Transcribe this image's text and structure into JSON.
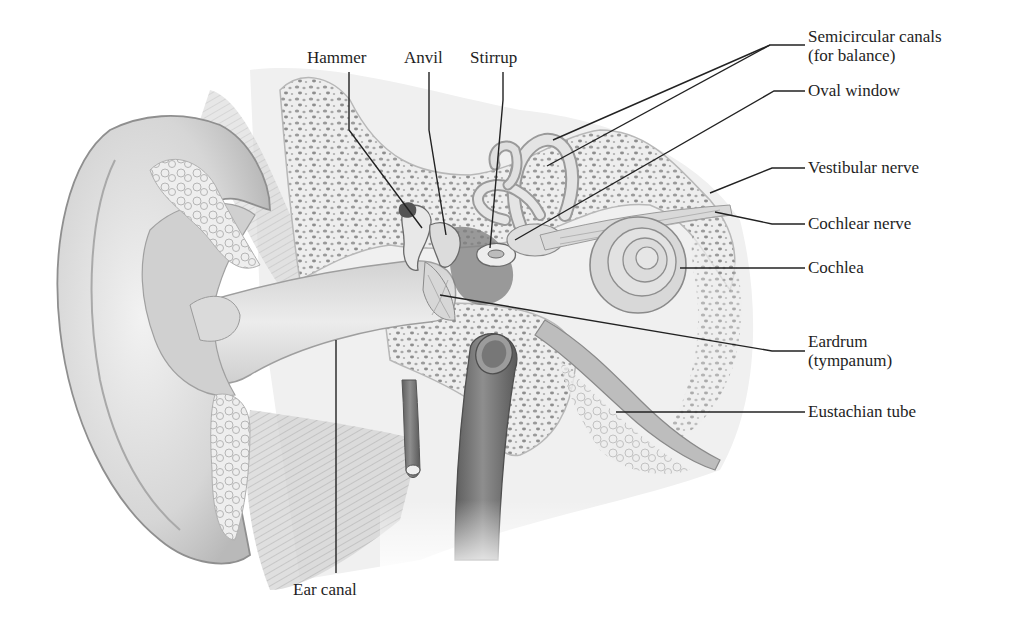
{
  "diagram": {
    "colors": {
      "background": "#ffffff",
      "label_text": "#1e1e1e",
      "leader_line": "#222222",
      "skin_light": "#e6e6e6",
      "skin_mid": "#c9c9c9",
      "skin_dark": "#9a9a9a",
      "bone_fill": "#ececec",
      "bone_pores": "#8c8c8c",
      "ossicle_dark": "#6a6a6a",
      "vessel_dark": "#6e6e6e"
    },
    "labels": {
      "hammer": "Hammer",
      "anvil": "Anvil",
      "stirrup": "Stirrup",
      "semicircular_canals_line1": "Semicircular canals",
      "semicircular_canals_line2": "(for balance)",
      "oval_window": "Oval window",
      "vestibular_nerve": "Vestibular nerve",
      "cochlear_nerve": "Cochlear nerve",
      "cochlea": "Cochlea",
      "eardrum_line1": "Eardrum",
      "eardrum_line2": "(tympanum)",
      "eustachian_tube": "Eustachian tube",
      "ear_canal": "Ear canal"
    }
  }
}
